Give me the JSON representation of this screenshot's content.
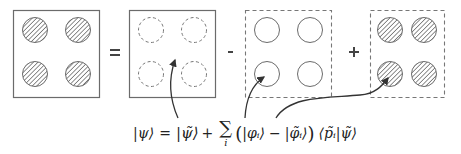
{
  "diagram": {
    "colors": {
      "stroke": "#6b6b6b",
      "hatch": "#555555",
      "arrow": "#333333",
      "background": "#ffffff"
    },
    "panels": [
      {
        "id": "all-electron",
        "border": "solid",
        "circles": "hatched",
        "description": "Full all-electron wavefunction"
      },
      {
        "id": "pseudo",
        "border": "solid",
        "circles": "dashed-empty",
        "description": "Pseudo wavefunction (smooth)"
      },
      {
        "id": "ae-partial",
        "border": "dashed",
        "circles": "solid-empty",
        "description": "All-electron partial waves"
      },
      {
        "id": "ps-partial",
        "border": "dashed",
        "circles": "hatched",
        "description": "Pseudo partial waves"
      }
    ],
    "operators": [
      {
        "symbol": "=",
        "between": [
          "all-electron",
          "pseudo"
        ]
      },
      {
        "symbol": "-",
        "between": [
          "pseudo",
          "ae-partial"
        ]
      },
      {
        "symbol": "+",
        "between": [
          "ae-partial",
          "ps-partial"
        ]
      }
    ],
    "formula": {
      "lhs": "|ψ⟩",
      "equals": "=",
      "term1": "|ψ̃⟩",
      "plus": "+",
      "sum": "∑",
      "sum_index": "i",
      "paren_open": "(",
      "phi": "|φᵢ⟩",
      "minus": "−",
      "phi_tilde": "|φ̃ᵢ⟩",
      "paren_close": ")",
      "projector": "⟨p̃ᵢ|ψ̃⟩",
      "full_text": "|ψ⟩ = |ψ̃⟩ + ∑ᵢ (|φᵢ⟩ − |φ̃ᵢ⟩) ⟨p̃ᵢ|ψ̃⟩"
    },
    "arrows": [
      {
        "from": "term1",
        "to": "pseudo"
      },
      {
        "from": "phi",
        "to": "ae-partial"
      },
      {
        "from": "phi_tilde",
        "to": "ps-partial"
      }
    ]
  }
}
